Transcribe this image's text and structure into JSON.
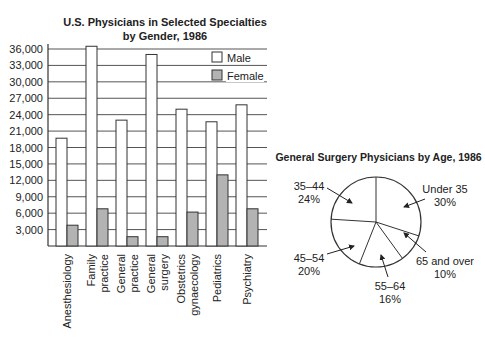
{
  "chart_data": [
    {
      "type": "bar",
      "title": "U.S. Physicians in Selected Specialties by Gender, 1986",
      "title_lines": [
        "U.S. Physicians in Selected Specialties",
        "by Gender, 1986"
      ],
      "xlabel": "",
      "ylabel": "",
      "ylim": [
        0,
        36000
      ],
      "yticks": [
        3000,
        6000,
        9000,
        12000,
        15000,
        18000,
        21000,
        24000,
        27000,
        30000,
        33000,
        36000
      ],
      "ytick_labels": [
        "3,000",
        "6,000",
        "9,000",
        "12,000",
        "15,000",
        "18,000",
        "21,000",
        "24,000",
        "27,000",
        "30,000",
        "33,000",
        "36,000"
      ],
      "grid": true,
      "legend_position": "upper right",
      "categories": [
        "Anesthesiology",
        "Family practice",
        "General practice",
        "General surgery",
        "Obstetrics gynaecology",
        "Pediatrics",
        "Psychiatry"
      ],
      "category_label_lines": [
        [
          "Anesthesiology"
        ],
        [
          "Family",
          "practice"
        ],
        [
          "General",
          "practice"
        ],
        [
          "General",
          "surgery"
        ],
        [
          "Obstetrics",
          "gynaecology"
        ],
        [
          "Pediatrics"
        ],
        [
          "Psychiatry"
        ]
      ],
      "series": [
        {
          "name": "Male",
          "color": "#ffffff",
          "values": [
            19700,
            36500,
            23000,
            35000,
            25000,
            22700,
            25800
          ]
        },
        {
          "name": "Female",
          "color": "#b3b3b3",
          "values": [
            3800,
            6800,
            1700,
            1700,
            6200,
            13000,
            6800
          ]
        }
      ]
    },
    {
      "type": "pie",
      "title": "General Surgery Physicians by Age, 1986",
      "start_angle_deg": 0,
      "direction": "clockwise",
      "slices": [
        {
          "label": "Under 35",
          "value": 30,
          "pct_label": "30%"
        },
        {
          "label": "65 and over",
          "value": 10,
          "pct_label": "10%"
        },
        {
          "label": "55–64",
          "value": 16,
          "pct_label": "16%"
        },
        {
          "label": "45–54",
          "value": 20,
          "pct_label": "20%"
        },
        {
          "label": "35–44",
          "value": 24,
          "pct_label": "24%"
        }
      ]
    }
  ],
  "colors": {
    "axis": "#333333",
    "grid": "#555555",
    "female_fill": "#b3b3b3",
    "male_fill": "#ffffff"
  }
}
